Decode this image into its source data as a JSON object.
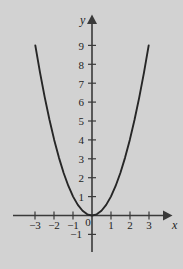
{
  "figure": {
    "background_color": "#d2d2d2",
    "curve_color": "#262626",
    "axis_color": "#3a3a3a",
    "text_color": "#232323",
    "x_axis_name": "x",
    "y_axis_name": "y"
  },
  "chart_data": {
    "type": "line",
    "title": "",
    "subtitle": "",
    "xlabel": "x",
    "ylabel": "y",
    "function": "y = x^2",
    "grid": false,
    "legend": null,
    "xlim": [
      -3.3,
      3.3
    ],
    "ylim": [
      -1.2,
      9.6
    ],
    "x_ticks": [
      -3,
      -2,
      -1,
      0,
      1,
      2,
      3
    ],
    "x_tick_labels": [
      "−3",
      "−2",
      "−1",
      "0",
      "1",
      "2",
      "3"
    ],
    "y_ticks": [
      -1,
      1,
      2,
      3,
      4,
      5,
      6,
      7,
      8,
      9
    ],
    "y_tick_labels": [
      "−1",
      "1",
      "2",
      "3",
      "4",
      "5",
      "6",
      "7",
      "8",
      "9"
    ],
    "x": [
      -3,
      -2.75,
      -2.5,
      -2.25,
      -2,
      -1.75,
      -1.5,
      -1.25,
      -1,
      -0.75,
      -0.5,
      -0.25,
      0,
      0.25,
      0.5,
      0.75,
      1,
      1.25,
      1.5,
      1.75,
      2,
      2.25,
      2.5,
      2.75,
      3
    ],
    "y": [
      9,
      7.5625,
      6.25,
      5.0625,
      4,
      3.0625,
      2.25,
      1.5625,
      1,
      0.5625,
      0.25,
      0.0625,
      0,
      0.0625,
      0.25,
      0.5625,
      1,
      1.5625,
      2.25,
      3.0625,
      4,
      5.0625,
      6.25,
      7.5625,
      9
    ]
  }
}
